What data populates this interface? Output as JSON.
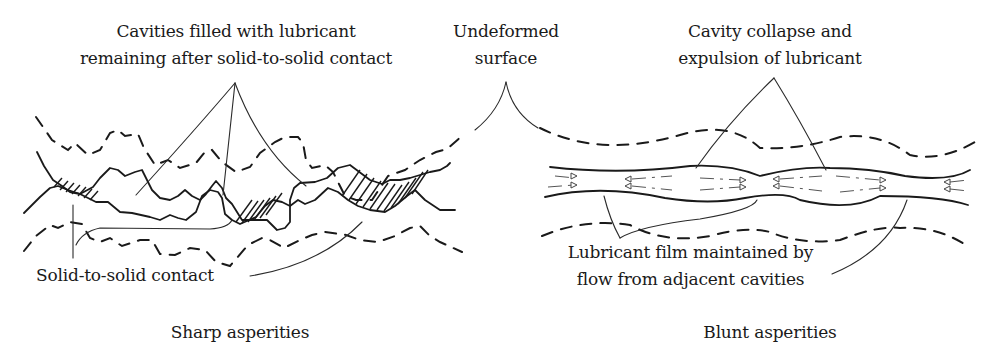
{
  "figure": {
    "left_panel": {
      "caption": "Sharp asperities",
      "labels": {
        "cavities_line1": "Cavities filled with lubricant",
        "cavities_line2": "remaining after solid-to-solid contact",
        "contact": "Solid-to-solid contact"
      }
    },
    "center": {
      "undeformed_line1": "Undeformed",
      "undeformed_line2": "surface"
    },
    "right_panel": {
      "caption": "Blunt asperities",
      "labels": {
        "collapse_line1": "Cavity collapse and",
        "collapse_line2": "expulsion of lubricant",
        "film_line1": "Lubricant film maintained by",
        "film_line2": "flow from adjacent cavities"
      }
    },
    "colors": {
      "ink": "#1a1a1a",
      "background": "#ffffff"
    }
  }
}
